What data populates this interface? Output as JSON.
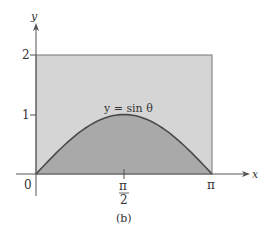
{
  "figure": {
    "caption": "(b)",
    "axes": {
      "x_label": "x",
      "y_label": "y",
      "origin_label": "0",
      "x_ticks": [
        {
          "label_num": "π",
          "label_den": "2",
          "value": "π/2"
        },
        {
          "label": "π",
          "value": "π"
        }
      ],
      "y_ticks": [
        {
          "label": "1",
          "value": 1
        },
        {
          "label": "2",
          "value": 2
        }
      ]
    },
    "curve_label": "y = sin θ",
    "regions": {
      "rectangle": {
        "x_range": "[0, π]",
        "y_range": "[0, 2]",
        "fill": "#d5d5d5"
      },
      "under_curve": {
        "function": "sin θ",
        "x_range": "[0, π]",
        "fill": "#a9a9a9"
      }
    },
    "colors": {
      "curve": "#4a4a4a",
      "axis": "#555555",
      "rect_border": "#777777"
    }
  },
  "chart_data": {
    "type": "area",
    "title": "",
    "xlabel": "x",
    "ylabel": "y",
    "x": [
      0,
      0.3927,
      0.7854,
      1.1781,
      1.5708,
      1.9635,
      2.3562,
      2.7489,
      3.1416
    ],
    "series": [
      {
        "name": "y = sin θ",
        "values": [
          0,
          0.383,
          0.707,
          0.924,
          1,
          0.924,
          0.707,
          0.383,
          0
        ]
      },
      {
        "name": "rectangle top y = 2",
        "values": [
          2,
          2,
          2,
          2,
          2,
          2,
          2,
          2,
          2
        ]
      }
    ],
    "x_tick_labels": [
      "0",
      "π/2",
      "π"
    ],
    "y_tick_labels": [
      "1",
      "2"
    ],
    "xlim": [
      0,
      3.1416
    ],
    "ylim": [
      0,
      2
    ],
    "grid": false,
    "annotations": [
      "y = sin θ",
      "(b)"
    ]
  }
}
